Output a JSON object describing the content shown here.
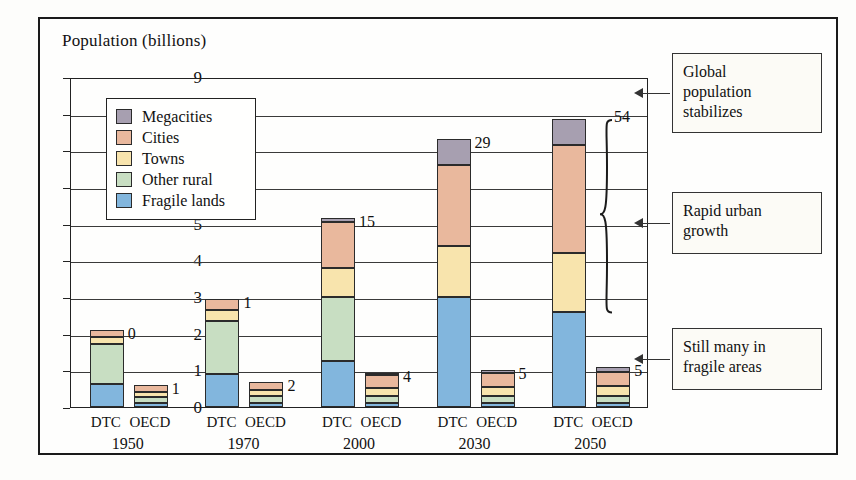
{
  "axis_title": "Population (billions)",
  "legend": {
    "items": [
      {
        "label": "Megacities",
        "color": "#a79fb0"
      },
      {
        "label": "Cities",
        "color": "#e9b89d"
      },
      {
        "label": "Towns",
        "color": "#f8e4ad"
      },
      {
        "label": "Other rural",
        "color": "#c8dec2"
      },
      {
        "label": "Fragile lands",
        "color": "#82b6dd"
      }
    ]
  },
  "annotations": [
    {
      "name": "global-population-stabilizes",
      "text": "Global\npopulation\nstabilizes",
      "y_value": 8.6
    },
    {
      "name": "rapid-urban-growth",
      "text": "Rapid urban\ngrowth",
      "y_value": 5.05
    },
    {
      "name": "still-many-in-fragile-areas",
      "text": "Still many in\nfragile areas",
      "y_value": 1.35
    }
  ],
  "brace": {
    "label": "54",
    "top_value": 7.85,
    "bottom_value": 2.6
  },
  "caption": "",
  "chart_data": {
    "type": "bar",
    "title": "",
    "subtitle": "",
    "xlabel": "",
    "ylabel": "Population (billions)",
    "ylim": [
      0,
      9
    ],
    "yticks": [
      0,
      1,
      2,
      3,
      4,
      5,
      6,
      7,
      8,
      9
    ],
    "grid": true,
    "stacked": true,
    "legend_position": "inside-upper-left",
    "groups": [
      "1950",
      "1970",
      "2000",
      "2030",
      "2050"
    ],
    "subcategories": [
      "DTC",
      "OECD"
    ],
    "series": [
      {
        "name": "Fragile lands",
        "color": "#82b6dd",
        "values": {
          "DTC": [
            0.62,
            0.9,
            1.25,
            3.0,
            2.6
          ],
          "OECD": [
            0.1,
            0.1,
            0.12,
            0.12,
            0.12
          ]
        }
      },
      {
        "name": "Other rural",
        "color": "#c8dec2",
        "values": {
          "DTC": [
            1.1,
            1.45,
            1.75,
            0.0,
            0.0
          ],
          "OECD": [
            0.18,
            0.2,
            0.18,
            0.18,
            0.18
          ]
        }
      },
      {
        "name": "Towns",
        "color": "#f8e4ad",
        "values": {
          "DTC": [
            0.18,
            0.3,
            0.8,
            1.4,
            1.6
          ],
          "OECD": [
            0.14,
            0.16,
            0.22,
            0.24,
            0.26
          ]
        }
      },
      {
        "name": "Cities",
        "color": "#e9b89d",
        "values": {
          "DTC": [
            0.2,
            0.3,
            1.25,
            2.2,
            2.95
          ],
          "OECD": [
            0.18,
            0.22,
            0.35,
            0.4,
            0.4
          ]
        }
      },
      {
        "name": "Megacities",
        "color": "#a79fb0",
        "values": {
          "DTC": [
            0.0,
            0.0,
            0.1,
            0.7,
            0.7
          ],
          "OECD": [
            0.0,
            0.0,
            0.05,
            0.06,
            0.14
          ]
        }
      }
    ],
    "totals": {
      "DTC": [
        2.1,
        2.95,
        5.15,
        7.3,
        7.85
      ],
      "OECD": [
        0.6,
        0.68,
        0.92,
        1.0,
        1.1
      ]
    },
    "point_labels": {
      "DTC": [
        "0",
        "1",
        "15",
        "29",
        "54"
      ],
      "OECD": [
        "1",
        "2",
        "4",
        "5",
        "5"
      ]
    }
  }
}
